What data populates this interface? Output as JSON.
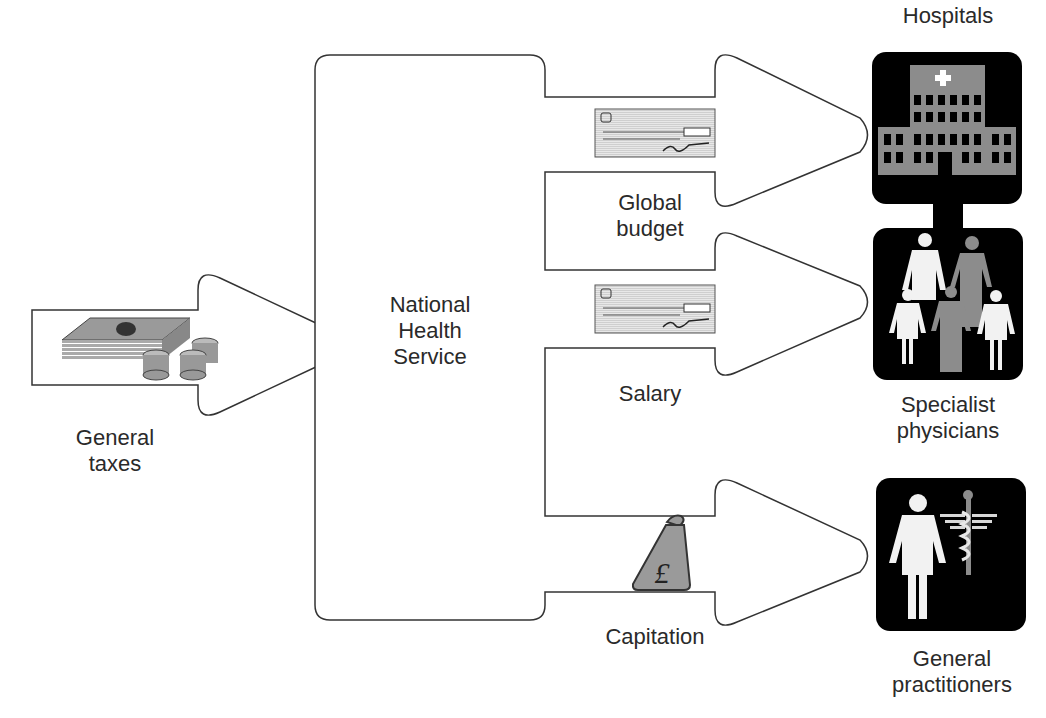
{
  "diagram": {
    "source": {
      "label_line1": "General",
      "label_line2": "taxes",
      "icon": "money-stack-icon"
    },
    "hub": {
      "label_line1": "National",
      "label_line2": "Health",
      "label_line3": "Service"
    },
    "flows": [
      {
        "label_line1": "Global",
        "label_line2": "budget",
        "icon": "cheque-icon",
        "target": "Hospitals"
      },
      {
        "label_line1": "Salary",
        "icon": "cheque-icon",
        "target": "Specialist physicians"
      },
      {
        "label_line1": "Capitation",
        "icon": "pound-moneybag-icon",
        "target": "General practitioners"
      }
    ],
    "targets": {
      "hospitals": {
        "label": "Hospitals"
      },
      "specialists": {
        "label_line1": "Specialist",
        "label_line2": "physicians"
      },
      "gps": {
        "label_line1": "General",
        "label_line2": "practitioners"
      }
    },
    "colors": {
      "stroke": "#333333",
      "tile": "#000000",
      "gray": "#8c8c8c",
      "light": "#f2f2f2"
    },
    "currency_symbol": "£"
  }
}
